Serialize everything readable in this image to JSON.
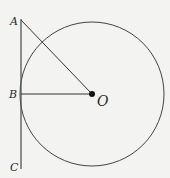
{
  "diagram": {
    "type": "geometry",
    "colors": {
      "background": "#f3f3f1",
      "stroke": "#3a3a3a",
      "point": "#111111"
    },
    "circle": {
      "center": "O",
      "cx": 92,
      "cy": 94,
      "r": 72
    },
    "points": [
      {
        "label": "A",
        "x": 21,
        "y": 20
      },
      {
        "label": "B",
        "x": 21,
        "y": 94
      },
      {
        "label": "C",
        "x": 21,
        "y": 168
      },
      {
        "label": "O",
        "x": 92,
        "y": 94
      }
    ],
    "segments": [
      {
        "from": "A",
        "to": "C",
        "name": "tangent line"
      },
      {
        "from": "A",
        "to": "O"
      },
      {
        "from": "B",
        "to": "O",
        "name": "radius"
      }
    ],
    "labels": {
      "a": "A",
      "b": "B",
      "c": "C",
      "o": "O"
    }
  }
}
